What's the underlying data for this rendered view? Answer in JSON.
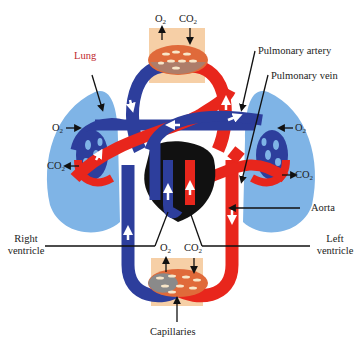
{
  "diagram": {
    "type": "circulatory-system",
    "colors": {
      "oxygenated": "#e8261c",
      "deoxygenated": "#2d3e9c",
      "lung": "#7fb4e6",
      "capillary_bed_bg": "#f6cfa6",
      "capillary_oxygenated": "#e06a3a",
      "capillary_deoxygenated": "#8a8a8a",
      "heart": "#111111",
      "lung_label": "#c0282d"
    },
    "labels": {
      "lung": "Lung",
      "pulmonary_artery": "Pulmonary artery",
      "pulmonary_vein": "Pulmonary vein",
      "aorta": "Aorta",
      "right_ventricle_line1": "Right",
      "right_ventricle_line2": "ventricle",
      "left_ventricle_line1": "Left",
      "left_ventricle_line2": "ventricle",
      "capillaries": "Capillaries"
    },
    "gases": {
      "o2": {
        "base": "O",
        "sub": "2"
      },
      "co2": {
        "base": "CO",
        "sub": "2"
      }
    }
  }
}
